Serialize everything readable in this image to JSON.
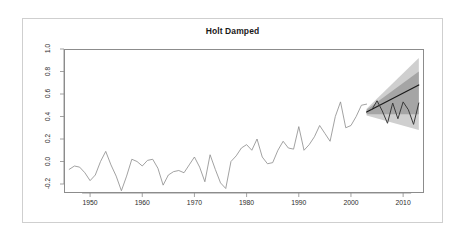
{
  "figure": {
    "title": "Holt Damped",
    "background_color": "#ffffff",
    "frame_color": "#cfcfcf",
    "axis_color": "#8c8c8c"
  },
  "chart_data": {
    "type": "line",
    "title": "Holt Damped",
    "xlabel": "",
    "ylabel": "",
    "grid": false,
    "legend_position": "none",
    "xlim": [
      1945,
      2014
    ],
    "ylim": [
      -0.28,
      1.0
    ],
    "yticks": [
      "1.0",
      "0.8",
      "0.6",
      "0.4",
      "0.2",
      "0.0",
      "-0.2"
    ],
    "ytick_values": [
      1.0,
      0.8,
      0.6,
      0.4,
      0.2,
      0.0,
      -0.2
    ],
    "xticks": [
      "1950",
      "1960",
      "1970",
      "1980",
      "1990",
      "2000",
      "2010"
    ],
    "xtick_values": [
      1950,
      1960,
      1970,
      1980,
      1990,
      2000,
      2010
    ],
    "series": [
      {
        "name": "historical",
        "color": "#8a8a8a",
        "x": [
          1946,
          1947,
          1948,
          1949,
          1950,
          1951,
          1952,
          1953,
          1954,
          1955,
          1956,
          1957,
          1958,
          1959,
          1960,
          1961,
          1962,
          1963,
          1964,
          1965,
          1966,
          1967,
          1968,
          1969,
          1970,
          1971,
          1972,
          1973,
          1974,
          1975,
          1976,
          1977,
          1978,
          1979,
          1980,
          1981,
          1982,
          1983,
          1984,
          1985,
          1986,
          1987,
          1988,
          1989,
          1990,
          1991,
          1992,
          1993,
          1994,
          1995,
          1996,
          1997,
          1998,
          1999,
          2000,
          2001,
          2002,
          2003
        ],
        "values": [
          -0.07,
          -0.04,
          -0.05,
          -0.1,
          -0.17,
          -0.12,
          0.0,
          0.09,
          -0.03,
          -0.13,
          -0.26,
          -0.13,
          0.02,
          0.0,
          -0.04,
          0.01,
          0.02,
          -0.06,
          -0.21,
          -0.12,
          -0.09,
          -0.08,
          -0.1,
          -0.03,
          0.04,
          -0.05,
          -0.18,
          0.06,
          -0.07,
          -0.19,
          -0.24,
          0.0,
          0.05,
          0.12,
          0.15,
          0.1,
          0.2,
          0.04,
          -0.02,
          -0.01,
          0.1,
          0.18,
          0.12,
          0.11,
          0.31,
          0.1,
          0.15,
          0.22,
          0.32,
          0.25,
          0.18,
          0.4,
          0.53,
          0.3,
          0.32,
          0.4,
          0.5,
          0.51
        ]
      },
      {
        "name": "forecast-mean",
        "color": "#1a1a1a",
        "x": [
          2003,
          2013
        ],
        "values": [
          0.44,
          0.68
        ]
      },
      {
        "name": "actual-future",
        "color": "#3a3a3a",
        "x": [
          2004,
          2005,
          2006,
          2007,
          2008,
          2009,
          2010,
          2011,
          2012,
          2013
        ],
        "values": [
          0.46,
          0.54,
          0.45,
          0.34,
          0.52,
          0.38,
          0.53,
          0.46,
          0.33,
          0.52
        ]
      }
    ],
    "intervals": [
      {
        "name": "95% prediction interval",
        "level": 95,
        "color": "#cfcfcf",
        "x": [
          2003,
          2013
        ],
        "lower": [
          0.41,
          0.28
        ],
        "upper": [
          0.47,
          0.92
        ]
      },
      {
        "name": "80% prediction interval",
        "level": 80,
        "color": "#a5a5a5",
        "x": [
          2003,
          2013
        ],
        "lower": [
          0.42,
          0.42
        ],
        "upper": [
          0.46,
          0.8
        ]
      }
    ]
  }
}
